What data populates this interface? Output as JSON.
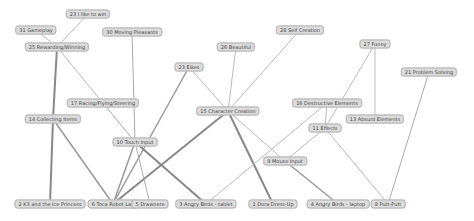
{
  "diagram": {
    "type": "network-graph",
    "nodes": [
      {
        "id": "n23a",
        "label": "23 I like to win",
        "x": 88,
        "y": 14
      },
      {
        "id": "n31",
        "label": "31 Gameplay",
        "x": 36,
        "y": 30
      },
      {
        "id": "n30",
        "label": "30 Moving Pleasants",
        "x": 132,
        "y": 32
      },
      {
        "id": "n25",
        "label": "25 Rewarding/Winning",
        "x": 57,
        "y": 47
      },
      {
        "id": "n28",
        "label": "28 Self Creation",
        "x": 300,
        "y": 30
      },
      {
        "id": "n26",
        "label": "26 Beautiful",
        "x": 236,
        "y": 47
      },
      {
        "id": "n27",
        "label": "27 Funny",
        "x": 375,
        "y": 44
      },
      {
        "id": "n23b",
        "label": "23 Eikes",
        "x": 189,
        "y": 67
      },
      {
        "id": "n21",
        "label": "21 Problem Solving",
        "x": 429,
        "y": 72
      },
      {
        "id": "n17",
        "label": "17 Racing/Flying/Steering",
        "x": 103,
        "y": 103
      },
      {
        "id": "n16",
        "label": "16 Destructive Elements",
        "x": 327,
        "y": 103
      },
      {
        "id": "n14",
        "label": "14 Collecting Items",
        "x": 53,
        "y": 119
      },
      {
        "id": "n15",
        "label": "15 Character Creation",
        "x": 228,
        "y": 111
      },
      {
        "id": "n13",
        "label": "13 Absurd Elements",
        "x": 375,
        "y": 119
      },
      {
        "id": "n11",
        "label": "11 Effects",
        "x": 325,
        "y": 128
      },
      {
        "id": "n10",
        "label": "10 Touch Input",
        "x": 135,
        "y": 142
      },
      {
        "id": "n9",
        "label": "9 Mouse Input",
        "x": 285,
        "y": 161
      },
      {
        "id": "n2",
        "label": "2 K3 and the Ice Princess",
        "x": 50,
        "y": 204
      },
      {
        "id": "n6",
        "label": "6 Toca Robot Lab",
        "x": 113,
        "y": 204
      },
      {
        "id": "n5",
        "label": "5 Drawnere",
        "x": 150,
        "y": 204
      },
      {
        "id": "n3",
        "label": "3 Angry Birds - tablet",
        "x": 206,
        "y": 204
      },
      {
        "id": "n1",
        "label": "1 Dora Dress-Up",
        "x": 273,
        "y": 204
      },
      {
        "id": "n4",
        "label": "4 Angry Birds - laptop",
        "x": 338,
        "y": 204
      },
      {
        "id": "n8",
        "label": "8 Putt-Putt",
        "x": 388,
        "y": 204
      }
    ],
    "edges": [
      {
        "from": "n23a",
        "to": "n25",
        "w": 1,
        "c": "#bbbbbb"
      },
      {
        "from": "n31",
        "to": "n25",
        "w": 1,
        "c": "#bbbbbb"
      },
      {
        "from": "n25",
        "to": "n14",
        "w": 2,
        "c": "#888888"
      },
      {
        "from": "n25",
        "to": "n10",
        "w": 1,
        "c": "#bbbbbb"
      },
      {
        "from": "n30",
        "to": "n10",
        "w": 1,
        "c": "#aaaaaa"
      },
      {
        "from": "n14",
        "to": "n2",
        "w": 2,
        "c": "#888888"
      },
      {
        "from": "n14",
        "to": "n6",
        "w": 1.5,
        "c": "#999999"
      },
      {
        "from": "n17",
        "to": "n10",
        "w": 1,
        "c": "#bbbbbb"
      },
      {
        "from": "n23b",
        "to": "n6",
        "w": 1.5,
        "c": "#999999"
      },
      {
        "from": "n23b",
        "to": "n15",
        "w": 1,
        "c": "#bbbbbb"
      },
      {
        "from": "n26",
        "to": "n15",
        "w": 1,
        "c": "#bbbbbb"
      },
      {
        "from": "n28",
        "to": "n15",
        "w": 1,
        "c": "#bbbbbb"
      },
      {
        "from": "n15",
        "to": "n6",
        "w": 2,
        "c": "#888888"
      },
      {
        "from": "n15",
        "to": "n1",
        "w": 2,
        "c": "#888888"
      },
      {
        "from": "n15",
        "to": "n9",
        "w": 1,
        "c": "#bbbbbb"
      },
      {
        "from": "n10",
        "to": "n6",
        "w": 1.5,
        "c": "#999999"
      },
      {
        "from": "n10",
        "to": "n5",
        "w": 1,
        "c": "#aaaaaa"
      },
      {
        "from": "n10",
        "to": "n3",
        "w": 2,
        "c": "#888888"
      },
      {
        "from": "n16",
        "to": "n3",
        "w": 1,
        "c": "#bbbbbb"
      },
      {
        "from": "n16",
        "to": "n11",
        "w": 1,
        "c": "#bbbbbb"
      },
      {
        "from": "n27",
        "to": "n11",
        "w": 1,
        "c": "#bbbbbb"
      },
      {
        "from": "n27",
        "to": "n13",
        "w": 1,
        "c": "#bbbbbb"
      },
      {
        "from": "n11",
        "to": "n9",
        "w": 1,
        "c": "#bbbbbb"
      },
      {
        "from": "n11",
        "to": "n8",
        "w": 1,
        "c": "#bbbbbb"
      },
      {
        "from": "n9",
        "to": "n4",
        "w": 1.5,
        "c": "#999999"
      },
      {
        "from": "n21",
        "to": "n8",
        "w": 1,
        "c": "#aaaaaa"
      }
    ]
  }
}
